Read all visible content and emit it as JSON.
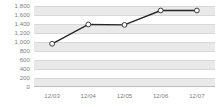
{
  "chart_data": {
    "type": "line",
    "title": "",
    "subtitle": "",
    "xlabel": "",
    "ylabel": "",
    "categories": [
      "12/03",
      "12/04",
      "12/05",
      "12/06",
      "12/07"
    ],
    "values": [
      960,
      1390,
      1380,
      1700,
      1700
    ],
    "series": [
      {
        "name": "",
        "values": [
          960,
          1390,
          1380,
          1700,
          1700
        ]
      }
    ],
    "ylim": [
      0,
      1800
    ],
    "ytick_step": 200,
    "ytick_labels": [
      "1,800",
      "1,600",
      "1,400",
      "1,200",
      "1,000",
      "800",
      "600",
      "400",
      "200",
      "0"
    ],
    "ytick_values": [
      1800,
      1600,
      1400,
      1200,
      1000,
      800,
      600,
      400,
      200,
      0
    ],
    "grid": true,
    "legend": "none",
    "marker": "open-circle",
    "colors": {
      "line": "#262626",
      "marker_fill": "#ffffff",
      "marker_stroke": "#3a3a3a",
      "band": "#e9e9e9",
      "gridline": "#d8d8d8",
      "plot_background": "#ffffff",
      "axis_text": "#7d7d7d",
      "baseline": "#bdbdbd"
    }
  }
}
